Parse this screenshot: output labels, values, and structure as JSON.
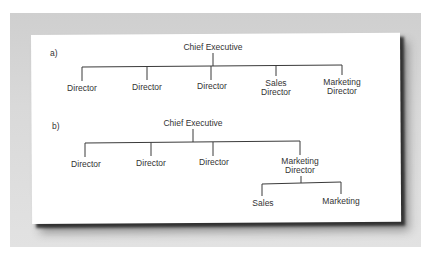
{
  "diagram_a": {
    "label": "a)",
    "root": "Chief Executive",
    "children": [
      {
        "line1": "Director",
        "line2": ""
      },
      {
        "line1": "Director",
        "line2": ""
      },
      {
        "line1": "Director",
        "line2": ""
      },
      {
        "line1": "Sales",
        "line2": "Director"
      },
      {
        "line1": "Marketing",
        "line2": "Director"
      }
    ]
  },
  "diagram_b": {
    "label": "b)",
    "root": "Chief Executive",
    "children": [
      {
        "line1": "Director",
        "line2": ""
      },
      {
        "line1": "Director",
        "line2": ""
      },
      {
        "line1": "Director",
        "line2": ""
      },
      {
        "line1": "Marketing",
        "line2": "Director"
      }
    ],
    "sub_children": [
      "Sales",
      "Marketing"
    ]
  },
  "colors": {
    "frame": "#d6d6d6",
    "card": "#ffffff",
    "line": "#3a3a3a",
    "text": "#333333"
  }
}
